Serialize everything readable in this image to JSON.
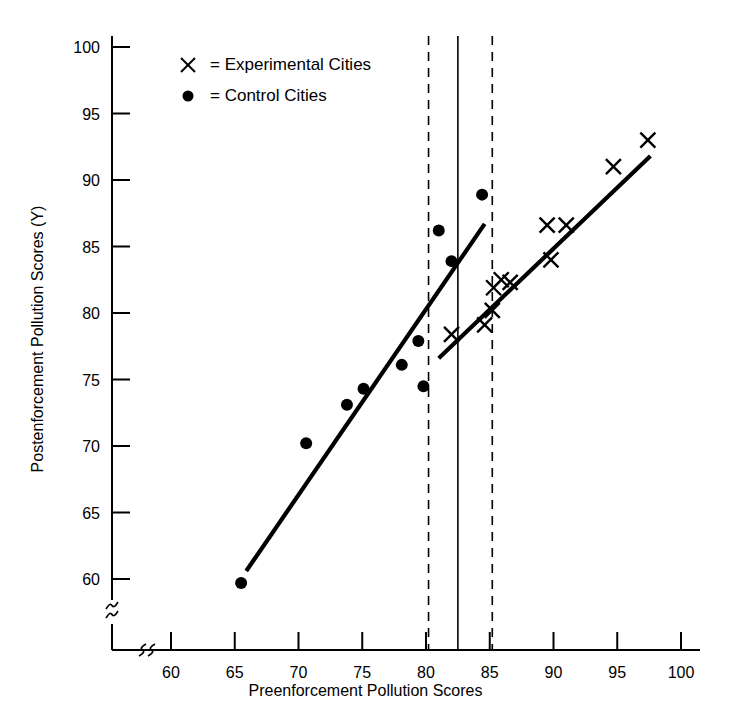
{
  "chart_data": {
    "type": "scatter",
    "title": "",
    "xlabel": "Preenforcement Pollution Scores",
    "ylabel": "Postenforcement Pollution Scores (Y)",
    "xlim": [
      57,
      101.5
    ],
    "ylim": [
      57.5,
      101.5
    ],
    "grid": false,
    "axis_break": true,
    "xticks": [
      60,
      65,
      70,
      75,
      80,
      85,
      90,
      95,
      100
    ],
    "yticks": [
      60,
      65,
      70,
      75,
      80,
      85,
      90,
      95,
      100
    ],
    "xtick_labels": [
      "60",
      "65",
      "70",
      "75",
      "80",
      "85",
      "90",
      "95",
      "100"
    ],
    "ytick_labels": [
      "60",
      "65",
      "70",
      "75",
      "80",
      "85",
      "90",
      "95",
      "100"
    ],
    "legend_position": "upper-left",
    "legend": [
      {
        "marker": "x",
        "symbol": "×",
        "label": "=  Experimental  Cities"
      },
      {
        "marker": "circle",
        "symbol": "●",
        "label": "=  Control Cities"
      }
    ],
    "series": [
      {
        "name": "Experimental Cities",
        "marker": "x",
        "points": [
          {
            "x": 82.0,
            "y": 78.4
          },
          {
            "x": 84.6,
            "y": 79.1
          },
          {
            "x": 85.3,
            "y": 81.9
          },
          {
            "x": 85.9,
            "y": 82.5
          },
          {
            "x": 85.2,
            "y": 80.2
          },
          {
            "x": 86.6,
            "y": 82.3
          },
          {
            "x": 89.5,
            "y": 86.6
          },
          {
            "x": 91.0,
            "y": 86.6
          },
          {
            "x": 89.8,
            "y": 84.0
          },
          {
            "x": 94.7,
            "y": 91.0
          },
          {
            "x": 97.4,
            "y": 93.0
          }
        ],
        "fit_line": {
          "x1": 81.0,
          "y1": 76.6,
          "x2": 97.6,
          "y2": 91.8
        }
      },
      {
        "name": "Control Cities",
        "marker": "circle",
        "points": [
          {
            "x": 65.5,
            "y": 59.7
          },
          {
            "x": 70.6,
            "y": 70.2
          },
          {
            "x": 73.8,
            "y": 73.1
          },
          {
            "x": 75.1,
            "y": 74.3
          },
          {
            "x": 78.1,
            "y": 76.1
          },
          {
            "x": 79.4,
            "y": 77.9
          },
          {
            "x": 79.8,
            "y": 74.5
          },
          {
            "x": 81.0,
            "y": 86.2
          },
          {
            "x": 82.0,
            "y": 83.9
          },
          {
            "x": 84.4,
            "y": 88.9
          }
        ],
        "fit_line": {
          "x1": 65.9,
          "y1": 60.6,
          "x2": 84.6,
          "y2": 86.7
        }
      }
    ],
    "reference_lines": [
      {
        "name": "lower-bound",
        "x": 80.2,
        "style": "dashed"
      },
      {
        "name": "cutoff",
        "x": 82.5,
        "style": "solid"
      },
      {
        "name": "upper-bound",
        "x": 85.2,
        "style": "solid-dashed"
      }
    ]
  }
}
